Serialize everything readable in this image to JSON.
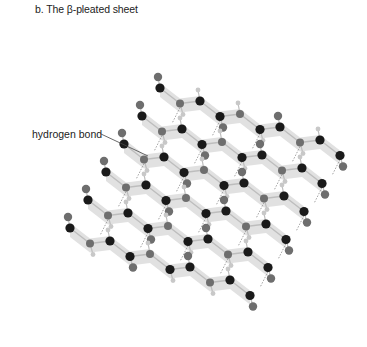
{
  "figure": {
    "title": "b. The β-pleated sheet",
    "annotations": [
      {
        "text": "hydrogen bond",
        "line_from": [
          101,
          134
        ],
        "line_to": [
          148,
          156
        ]
      }
    ]
  },
  "colors": {
    "ribbon": "#dcdcdc",
    "carbon": "#1a1a1a",
    "heteroatom": "#6e6e6e",
    "hydrogen": "#c8c8c8",
    "bond": "#bdbdbd",
    "hbond": "#8a8a8a",
    "text": "#222222"
  },
  "strands": [
    {
      "offset": [
        0,
        0
      ]
    },
    {
      "offset": [
        -18,
        28
      ]
    },
    {
      "offset": [
        -36,
        56
      ]
    },
    {
      "offset": [
        -54,
        84
      ]
    },
    {
      "offset": [
        -72,
        112
      ]
    },
    {
      "offset": [
        -90,
        140
      ]
    }
  ]
}
